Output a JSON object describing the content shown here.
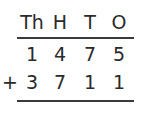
{
  "headers": [
    "Th",
    "H",
    "T",
    "O"
  ],
  "rows": [
    {
      "sign": "",
      "digits": [
        "1",
        "4",
        "7",
        "5"
      ]
    },
    {
      "sign": "+",
      "digits": [
        "3",
        "7",
        "1",
        "1"
      ]
    }
  ],
  "colors": {
    "text": "#2a2a2a",
    "line": "#3a3a3a"
  }
}
